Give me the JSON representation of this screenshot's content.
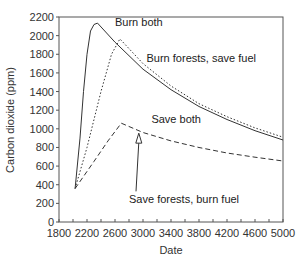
{
  "chart_data": {
    "type": "line",
    "title": "",
    "xlabel": "Date",
    "ylabel": "Carbon dioxide (ppm)",
    "xlim": [
      1800,
      5000
    ],
    "ylim": [
      0,
      2200
    ],
    "x_ticks": [
      1800,
      2200,
      2600,
      3000,
      3400,
      3800,
      4200,
      4600,
      5000
    ],
    "y_ticks": [
      0,
      200,
      400,
      600,
      800,
      1000,
      1200,
      1400,
      1600,
      1800,
      2000,
      2200
    ],
    "grid": false,
    "legend": "none (direct annotations)",
    "series": [
      {
        "name": "Burn both",
        "style": "solid",
        "points": [
          [
            2030,
            360
          ],
          [
            2100,
            900
          ],
          [
            2150,
            1400
          ],
          [
            2200,
            1800
          ],
          [
            2250,
            2050
          ],
          [
            2300,
            2120
          ],
          [
            2350,
            2135
          ],
          [
            2600,
            1930
          ],
          [
            3000,
            1640
          ],
          [
            3400,
            1420
          ],
          [
            3800,
            1240
          ],
          [
            4200,
            1100
          ],
          [
            4600,
            980
          ],
          [
            5000,
            880
          ]
        ]
      },
      {
        "name": "Burn forests, save fuel",
        "style": "dotted",
        "points": [
          [
            2030,
            360
          ],
          [
            2200,
            800
          ],
          [
            2400,
            1400
          ],
          [
            2550,
            1800
          ],
          [
            2670,
            1965
          ],
          [
            3000,
            1700
          ],
          [
            3400,
            1460
          ],
          [
            3800,
            1270
          ],
          [
            4200,
            1130
          ],
          [
            4600,
            1010
          ],
          [
            5000,
            910
          ]
        ]
      },
      {
        "name": "Save both",
        "style": "dashed",
        "points": [
          [
            2030,
            360
          ],
          [
            2300,
            650
          ],
          [
            2500,
            870
          ],
          [
            2690,
            1060
          ],
          [
            3000,
            960
          ],
          [
            3400,
            870
          ],
          [
            3800,
            800
          ],
          [
            4200,
            740
          ],
          [
            4600,
            695
          ],
          [
            5000,
            655
          ]
        ]
      },
      {
        "name": "Save forests, burn fuel",
        "style": "arrow annotation pointing to Save both curve",
        "points": [
          [
            2940,
            975
          ]
        ]
      }
    ],
    "annotations": [
      {
        "text": "Burn both",
        "x": 2600,
        "y": 2100
      },
      {
        "text": "Burn forests, save fuel",
        "x": 3050,
        "y": 1720
      },
      {
        "text": "Save both",
        "x": 3120,
        "y": 1060
      },
      {
        "text": "Save forests, burn fuel",
        "x": 2800,
        "y": 200,
        "arrow_to": [
          2940,
          975
        ]
      }
    ]
  }
}
